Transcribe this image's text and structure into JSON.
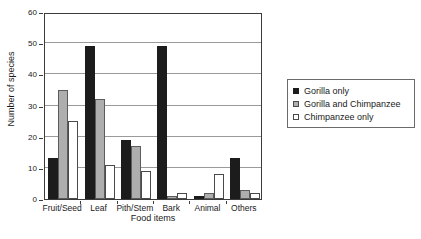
{
  "chart_data": {
    "type": "bar",
    "title": "",
    "xlabel": "Food items",
    "ylabel": "Number of species",
    "ylim": [
      0,
      60
    ],
    "ytick_step": 10,
    "yticks": [
      0,
      10,
      20,
      30,
      40,
      50,
      60
    ],
    "grid": true,
    "legend_position": "right",
    "categories": [
      "Fruit/Seed",
      "Leaf",
      "Pith/Stem",
      "Bark",
      "Animal",
      "Others"
    ],
    "series": [
      {
        "name": "Gorilla only",
        "color": "#1c1c1c",
        "values": [
          13,
          49,
          19,
          49,
          1,
          13
        ]
      },
      {
        "name": "Gorilla and Chimpanzee",
        "color": "#aeaeae",
        "values": [
          35,
          32,
          17,
          1,
          2,
          3
        ]
      },
      {
        "name": "Chimpanzee only",
        "color": "#ffffff",
        "values": [
          25,
          11,
          9,
          2,
          8,
          2
        ]
      }
    ]
  },
  "legend": {
    "items": [
      {
        "label": "Gorilla only",
        "swatch": "black-square-icon"
      },
      {
        "label": "Gorilla and Chimpanzee",
        "swatch": "gray-square-icon"
      },
      {
        "label": "Chimpanzee only",
        "swatch": "white-square-icon"
      }
    ]
  }
}
